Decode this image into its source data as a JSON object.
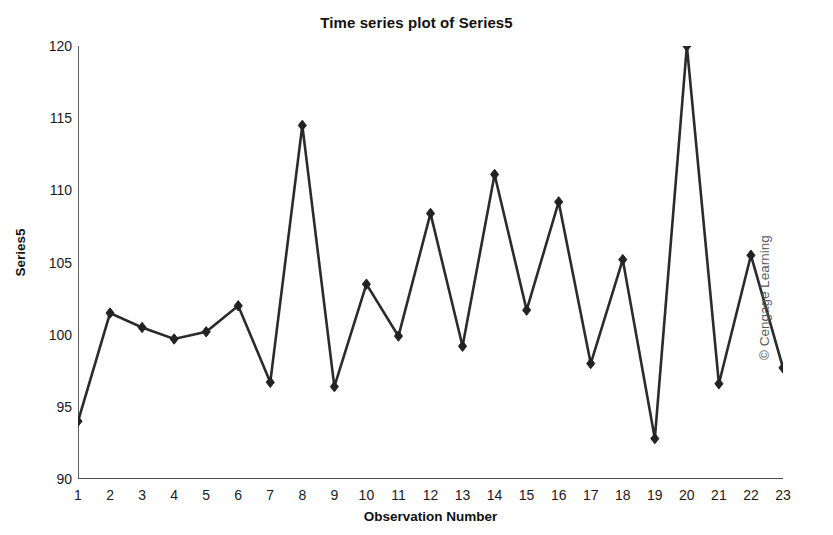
{
  "chart_data": {
    "type": "line",
    "title": "Time series plot of Series5",
    "xlabel": "Observation Number",
    "ylabel": "Series5",
    "x": [
      1,
      2,
      3,
      4,
      5,
      6,
      7,
      8,
      9,
      10,
      11,
      12,
      13,
      14,
      15,
      16,
      17,
      18,
      19,
      20,
      21,
      22,
      23
    ],
    "values": [
      94.0,
      101.5,
      100.5,
      99.7,
      100.2,
      102.0,
      96.7,
      114.5,
      96.4,
      103.5,
      99.9,
      108.4,
      99.2,
      111.1,
      101.7,
      109.2,
      98.0,
      105.2,
      92.8,
      120.0,
      96.6,
      105.5,
      97.7
    ],
    "series": [
      {
        "name": "Series5",
        "values": [
          94.0,
          101.5,
          100.5,
          99.7,
          100.2,
          102.0,
          96.7,
          114.5,
          96.4,
          103.5,
          99.9,
          108.4,
          99.2,
          111.1,
          101.7,
          109.2,
          98.0,
          105.2,
          92.8,
          120.0,
          96.6,
          105.5,
          97.7
        ]
      }
    ],
    "xlim": [
      1,
      23
    ],
    "ylim": [
      90,
      120
    ],
    "yticks": [
      90,
      95,
      100,
      105,
      110,
      115,
      120
    ],
    "ytick_labels": [
      "90",
      "95",
      "100",
      "105",
      "110",
      "115",
      "120"
    ],
    "xticks": [
      1,
      2,
      3,
      4,
      5,
      6,
      7,
      8,
      9,
      10,
      11,
      12,
      13,
      14,
      15,
      16,
      17,
      18,
      19,
      20,
      21,
      22,
      23
    ],
    "xtick_labels": [
      "1",
      "2",
      "3",
      "4",
      "5",
      "6",
      "7",
      "8",
      "9",
      "10",
      "11",
      "12",
      "13",
      "14",
      "15",
      "16",
      "17",
      "18",
      "19",
      "20",
      "21",
      "22",
      "23"
    ],
    "grid": false,
    "legend": false,
    "legend_position": "none",
    "marker": "diamond",
    "line_color": "#2b2b2b",
    "marker_color": "#222222",
    "axis_color": "#4d4d4d",
    "background_color": "#ffffff"
  },
  "credit": {
    "text": "© Cengage Learning"
  }
}
